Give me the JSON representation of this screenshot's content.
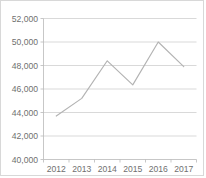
{
  "chart_data": {
    "type": "line",
    "title": "",
    "subtitle": "",
    "xlabel": "",
    "ylabel": "",
    "categories": [
      "2012",
      "2013",
      "2014",
      "2015",
      "2016",
      "2017"
    ],
    "x": [
      2012,
      2013,
      2014,
      2015,
      2016,
      2017
    ],
    "values": [
      43700,
      45200,
      48400,
      46350,
      50000,
      47900
    ],
    "series": [
      {
        "name": "",
        "values": [
          43700,
          45200,
          48400,
          46350,
          50000,
          47900
        ]
      }
    ],
    "ylim": [
      40000,
      52000
    ],
    "ytick_values": [
      40000,
      42000,
      44000,
      46000,
      48000,
      50000,
      52000
    ],
    "ytick_labels": [
      "40,000",
      "42,000",
      "44,000",
      "46,000",
      "48,000",
      "50,000",
      "52,000"
    ],
    "xtick_labels": [
      "2012",
      "2013",
      "2014",
      "2015",
      "2016",
      "2017"
    ],
    "grid": "horizontal",
    "legend": "none",
    "annotations": [],
    "colors": {
      "line": "#b3b3b3",
      "gridline": "#c9c9c9",
      "axis": "#b9b9b9",
      "tick_label": "#6f6f6f",
      "background": "#ffffff",
      "border": "#d8d8d8"
    }
  }
}
